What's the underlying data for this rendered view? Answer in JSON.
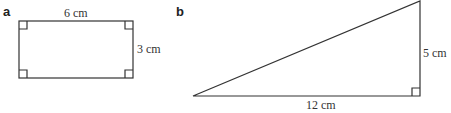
{
  "figure_a": {
    "label": "a",
    "shape": "rectangle",
    "top_side": "6 cm",
    "right_side": "3 cm",
    "right_angle_markers": 4
  },
  "figure_b": {
    "label": "b",
    "shape": "right triangle",
    "base": "12 cm",
    "height": "5 cm",
    "right_angle_markers": 1
  },
  "colors": {
    "stroke": "#333333",
    "text": "#333333"
  }
}
